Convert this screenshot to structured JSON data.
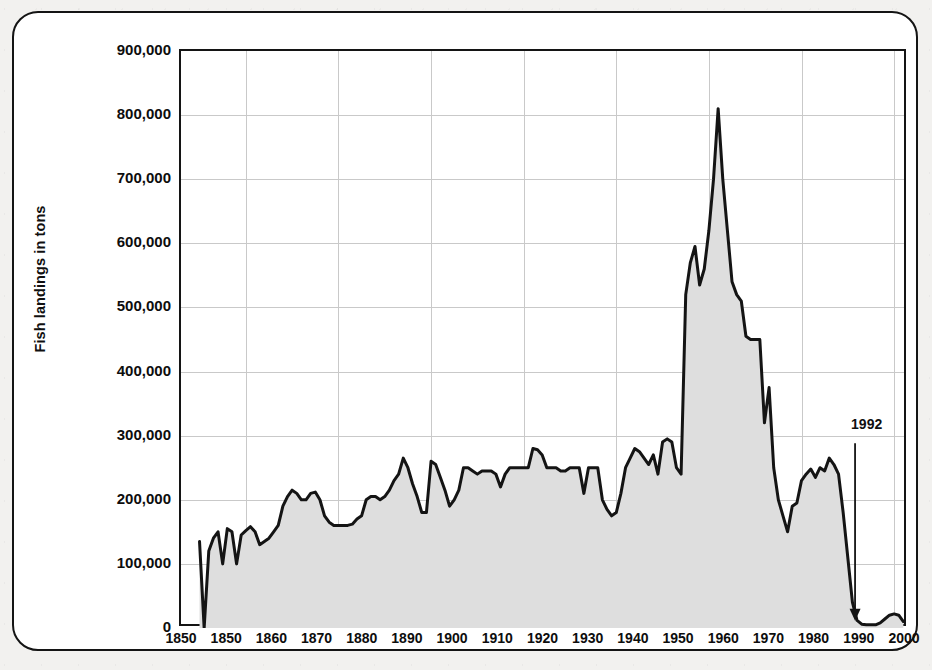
{
  "figure": {
    "frame_color": "#141414",
    "background_color": "#ffffff",
    "page_background": "#f2f1ef"
  },
  "chart_data": {
    "type": "area",
    "title": "",
    "subtitle": "",
    "xlabel": "",
    "ylabel": "Fish landings in tons",
    "xlim": [
      1846,
      2003
    ],
    "ylim": [
      0,
      900000
    ],
    "grid": "both",
    "legend_position": "none",
    "line_color": "#141414",
    "fill_color": "#dedede",
    "y_ticks": [
      0,
      100000,
      200000,
      300000,
      400000,
      500000,
      600000,
      700000,
      800000,
      900000
    ],
    "y_tick_labels": [
      "0",
      "100,000",
      "200,000",
      "300,000",
      "400,000",
      "500,000",
      "600,000",
      "700,000",
      "800,000",
      "900,000"
    ],
    "x_ticks": [
      1850,
      1850,
      1860,
      1870,
      1880,
      1890,
      1900,
      1910,
      1920,
      1930,
      1940,
      1950,
      1960,
      1970,
      1980,
      1990,
      2000
    ],
    "x_tick_labels": [
      "1850",
      "1850",
      "1860",
      "1870",
      "1880",
      "1890",
      "1900",
      "1910",
      "1920",
      "1930",
      "1940",
      "1950",
      "1960",
      "1970",
      "1980",
      "1990",
      "2000"
    ],
    "x_gridlines": [
      1860,
      1880,
      1900,
      1920,
      1940,
      1960,
      1980,
      2000
    ],
    "annotations": [
      {
        "text": "1992",
        "x": 1992,
        "label_y": 300000,
        "arrow_from_y": 285000,
        "arrow_to_y": 8000,
        "kind": "down-arrow"
      }
    ],
    "x": [
      1850,
      1851,
      1852,
      1853,
      1854,
      1855,
      1856,
      1857,
      1858,
      1859,
      1860,
      1861,
      1862,
      1863,
      1864,
      1865,
      1866,
      1867,
      1868,
      1869,
      1870,
      1871,
      1872,
      1873,
      1874,
      1875,
      1876,
      1877,
      1878,
      1879,
      1880,
      1881,
      1882,
      1883,
      1884,
      1885,
      1886,
      1887,
      1888,
      1889,
      1890,
      1891,
      1892,
      1893,
      1894,
      1895,
      1896,
      1897,
      1898,
      1899,
      1900,
      1901,
      1902,
      1903,
      1904,
      1905,
      1906,
      1907,
      1908,
      1909,
      1910,
      1911,
      1912,
      1913,
      1914,
      1915,
      1916,
      1917,
      1918,
      1919,
      1920,
      1921,
      1922,
      1923,
      1924,
      1925,
      1926,
      1927,
      1928,
      1929,
      1930,
      1931,
      1932,
      1933,
      1934,
      1935,
      1936,
      1937,
      1938,
      1939,
      1940,
      1941,
      1942,
      1943,
      1944,
      1945,
      1946,
      1947,
      1948,
      1949,
      1950,
      1951,
      1952,
      1953,
      1954,
      1955,
      1956,
      1957,
      1958,
      1959,
      1960,
      1961,
      1962,
      1963,
      1964,
      1965,
      1966,
      1967,
      1968,
      1969,
      1970,
      1971,
      1972,
      1973,
      1974,
      1975,
      1976,
      1977,
      1978,
      1979,
      1980,
      1981,
      1982,
      1983,
      1984,
      1985,
      1986,
      1987,
      1988,
      1989,
      1990,
      1991,
      1992,
      1993,
      1994,
      1995,
      1996,
      1997,
      1998,
      1999,
      2000,
      2001,
      2002
    ],
    "values": [
      135000,
      0,
      120000,
      140000,
      150000,
      100000,
      155000,
      150000,
      100000,
      145000,
      152000,
      158000,
      150000,
      130000,
      135000,
      140000,
      150000,
      160000,
      190000,
      205000,
      215000,
      210000,
      200000,
      200000,
      210000,
      212000,
      200000,
      175000,
      165000,
      160000,
      160000,
      160000,
      160000,
      162000,
      170000,
      175000,
      200000,
      205000,
      205000,
      200000,
      205000,
      215000,
      230000,
      240000,
      265000,
      250000,
      225000,
      205000,
      180000,
      180000,
      260000,
      255000,
      235000,
      215000,
      190000,
      200000,
      215000,
      250000,
      250000,
      245000,
      240000,
      245000,
      245000,
      245000,
      240000,
      220000,
      240000,
      250000,
      250000,
      250000,
      250000,
      250000,
      280000,
      278000,
      270000,
      250000,
      250000,
      250000,
      245000,
      245000,
      250000,
      250000,
      250000,
      210000,
      250000,
      250000,
      250000,
      200000,
      185000,
      175000,
      180000,
      210000,
      250000,
      265000,
      280000,
      275000,
      265000,
      255000,
      270000,
      240000,
      290000,
      295000,
      290000,
      250000,
      240000,
      520000,
      570000,
      595000,
      535000,
      560000,
      620000,
      700000,
      810000,
      700000,
      620000,
      540000,
      520000,
      510000,
      455000,
      450000,
      450000,
      450000,
      320000,
      375000,
      250000,
      200000,
      175000,
      150000,
      190000,
      195000,
      230000,
      240000,
      248000,
      235000,
      250000,
      245000,
      265000,
      255000,
      240000,
      180000,
      110000,
      40000,
      12000,
      6000,
      5000,
      5000,
      5000,
      8000,
      14000,
      20000,
      22000,
      20000,
      10000
    ]
  }
}
